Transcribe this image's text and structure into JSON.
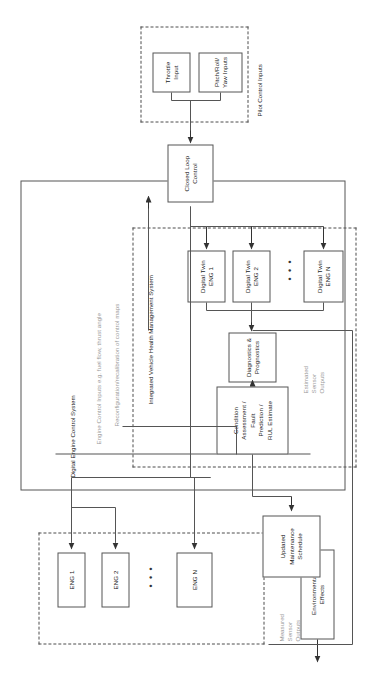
{
  "diagram": {
    "groups": {
      "engines": {
        "label": "",
        "ellipsis": "• • •"
      },
      "ivhms": {
        "label": "Integrated Vehicle Health Management System",
        "ellipsis": "• • •"
      },
      "pilot": {
        "label": "Pilot Control Inputs"
      },
      "decs": {
        "label": "Digital Engine Control System"
      }
    },
    "boxes": {
      "environmental_effects": "Environmental\nEffects",
      "eng1": "ENG 1",
      "eng2": "ENG 2",
      "engn": "ENG N",
      "updated_maintenance_schedule": "Updated\nMaintenance\nSchedule",
      "condition_assessment": "Condition\nAssessment /\nFault\nPrediction /\nRUL Estimate",
      "diagnostics_prognostics": "Diagnostics &\nPrognostics",
      "digital_twin_eng1": "Digital Twin\nENG 1",
      "digital_twin_eng2": "Digital Twin\nENG 2",
      "digital_twin_engn": "Digital Twin\nENG N",
      "closed_loop_control": "Closed Loop\nControl",
      "throttle_input": "Throttle\nInput",
      "pitch_roll_yaw_inputs": "Pitch/Roll/\nYaw Inputs"
    },
    "annotations": {
      "measured_sensor_outputs": "Measured\nSensor\nOutputs",
      "estimated_sensor_outputs": "Estimated\nSensor\nOutputs",
      "engine_control_inputs": "Engine Control Inputs e.g. fuel flow, thrust angle",
      "reconfiguration": "Reconfiguration/recalibration of control maps"
    },
    "colors": {
      "line": "#555555",
      "dash": "#4d4d4d",
      "text": "#1a1a1a",
      "muted_text": "#9a9a9a",
      "background": "#ffffff"
    }
  }
}
